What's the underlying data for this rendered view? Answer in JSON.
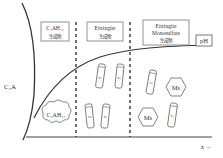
{
  "diagram": {
    "y_axis_top_label": "C3A",
    "left_label": "C₃A",
    "x_axis_label": "x →",
    "ph_label": "pH",
    "stages": [
      {
        "line1": "C₄AH₁₃",
        "line2": "生成物"
      },
      {
        "line1": "Ettringite",
        "line2": "生成物"
      },
      {
        "line1": "Ettringite",
        "line1b": "Monosulfate",
        "line2": "生成物"
      }
    ],
    "cloud_label": "C₄AH₁₃",
    "ettringite_label": "Ett",
    "monosulfate_label": "Ms"
  },
  "colors": {
    "stroke": "#333333",
    "box": "#666666",
    "text": "#333333"
  }
}
